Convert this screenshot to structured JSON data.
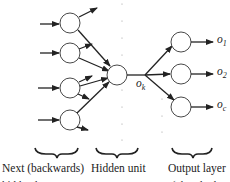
{
  "diagram": {
    "type": "neural-network-backprop",
    "hidden_unit_output_label": "o_k",
    "hidden_unit_output_base": "o",
    "hidden_unit_output_sub": "k",
    "outputs": [
      {
        "base": "o",
        "sub": "1"
      },
      {
        "base": "o",
        "sub": "2"
      },
      {
        "base": "o",
        "sub": "c"
      }
    ],
    "captions": {
      "left": "Next (backwards)",
      "middle": "Hidden unit",
      "right": "Output layer"
    },
    "captions_cut": {
      "left": "hidden layer",
      "right": "(already done)"
    },
    "colors": {
      "stroke": "#222222",
      "background": "#ffffff"
    }
  }
}
